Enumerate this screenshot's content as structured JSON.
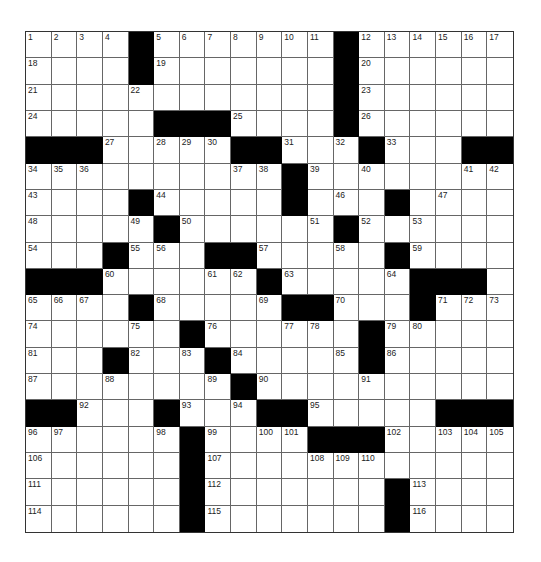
{
  "puzzle": {
    "rows": 19,
    "cols": 19,
    "colors": {
      "block": "#000000",
      "cell": "#ffffff",
      "line": "#666666"
    },
    "grid": [
      "....#.......#......",
      "....#.......#......",
      "............#......",
      ".....###....#......",
      "###.....##...#...##",
      "..........#........",
      "....#.....#...#....",
      ".....#......#......",
      "...#...##.....#....",
      "###......#.....###.",
      "....#.....##...#...",
      "......#......#.....",
      "...#...#.....#.....",
      "........#..........",
      "##...#...##.....###",
      "......#....###.....",
      "......#............",
      "......#.......#....",
      "......#.......#...."
    ],
    "numbers": [
      [
        0,
        0,
        1
      ],
      [
        0,
        1,
        2
      ],
      [
        0,
        2,
        3
      ],
      [
        0,
        3,
        4
      ],
      [
        0,
        5,
        5
      ],
      [
        0,
        6,
        6
      ],
      [
        0,
        7,
        7
      ],
      [
        0,
        8,
        8
      ],
      [
        0,
        9,
        9
      ],
      [
        0,
        10,
        10
      ],
      [
        0,
        11,
        11
      ],
      [
        0,
        13,
        12
      ],
      [
        0,
        14,
        13
      ],
      [
        0,
        15,
        14
      ],
      [
        0,
        16,
        15
      ],
      [
        0,
        17,
        16
      ],
      [
        0,
        18,
        17
      ],
      [
        1,
        0,
        18
      ],
      [
        1,
        5,
        19
      ],
      [
        1,
        13,
        20
      ],
      [
        2,
        0,
        21
      ],
      [
        2,
        4,
        22
      ],
      [
        2,
        13,
        23
      ],
      [
        3,
        0,
        24
      ],
      [
        3,
        8,
        25
      ],
      [
        3,
        13,
        26
      ],
      [
        4,
        3,
        27
      ],
      [
        4,
        5,
        28
      ],
      [
        4,
        6,
        29
      ],
      [
        4,
        7,
        30
      ],
      [
        4,
        10,
        31
      ],
      [
        4,
        12,
        32
      ],
      [
        4,
        14,
        33
      ],
      [
        5,
        0,
        34
      ],
      [
        5,
        1,
        35
      ],
      [
        5,
        2,
        36
      ],
      [
        5,
        8,
        37
      ],
      [
        5,
        9,
        38
      ],
      [
        5,
        11,
        39
      ],
      [
        5,
        13,
        40
      ],
      [
        5,
        17,
        41
      ],
      [
        5,
        18,
        42
      ],
      [
        6,
        0,
        43
      ],
      [
        6,
        5,
        44
      ],
      [
        6,
        10,
        45
      ],
      [
        6,
        12,
        46
      ],
      [
        6,
        16,
        47
      ],
      [
        7,
        0,
        48
      ],
      [
        7,
        4,
        49
      ],
      [
        7,
        6,
        50
      ],
      [
        7,
        11,
        51
      ],
      [
        7,
        13,
        52
      ],
      [
        7,
        15,
        53
      ],
      [
        8,
        0,
        54
      ],
      [
        8,
        4,
        55
      ],
      [
        8,
        5,
        56
      ],
      [
        8,
        9,
        57
      ],
      [
        8,
        12,
        58
      ],
      [
        8,
        15,
        59
      ],
      [
        9,
        3,
        60
      ],
      [
        9,
        7,
        61
      ],
      [
        9,
        8,
        62
      ],
      [
        9,
        10,
        63
      ],
      [
        9,
        14,
        64
      ],
      [
        10,
        0,
        65
      ],
      [
        10,
        1,
        66
      ],
      [
        10,
        2,
        67
      ],
      [
        10,
        5,
        68
      ],
      [
        10,
        9,
        69
      ],
      [
        10,
        12,
        70
      ],
      [
        10,
        16,
        71
      ],
      [
        10,
        17,
        72
      ],
      [
        10,
        18,
        73
      ],
      [
        11,
        0,
        74
      ],
      [
        11,
        4,
        75
      ],
      [
        11,
        7,
        76
      ],
      [
        11,
        10,
        77
      ],
      [
        11,
        11,
        78
      ],
      [
        11,
        14,
        79
      ],
      [
        11,
        15,
        80
      ],
      [
        12,
        0,
        81
      ],
      [
        12,
        4,
        82
      ],
      [
        12,
        6,
        83
      ],
      [
        12,
        8,
        84
      ],
      [
        12,
        12,
        85
      ],
      [
        12,
        14,
        86
      ],
      [
        13,
        0,
        87
      ],
      [
        13,
        3,
        88
      ],
      [
        13,
        7,
        89
      ],
      [
        13,
        9,
        90
      ],
      [
        13,
        13,
        91
      ],
      [
        14,
        2,
        92
      ],
      [
        14,
        6,
        93
      ],
      [
        14,
        8,
        94
      ],
      [
        14,
        11,
        95
      ],
      [
        15,
        0,
        96
      ],
      [
        15,
        1,
        97
      ],
      [
        15,
        5,
        98
      ],
      [
        15,
        7,
        99
      ],
      [
        15,
        9,
        100
      ],
      [
        15,
        10,
        101
      ],
      [
        15,
        14,
        102
      ],
      [
        15,
        16,
        103
      ],
      [
        15,
        17,
        104
      ],
      [
        15,
        18,
        105
      ],
      [
        16,
        0,
        106
      ],
      [
        16,
        7,
        107
      ],
      [
        16,
        11,
        108
      ],
      [
        16,
        12,
        109
      ],
      [
        16,
        13,
        110
      ],
      [
        17,
        0,
        111
      ],
      [
        17,
        7,
        112
      ],
      [
        17,
        15,
        113
      ],
      [
        18,
        0,
        114
      ],
      [
        18,
        7,
        115
      ],
      [
        18,
        15,
        116
      ]
    ]
  }
}
